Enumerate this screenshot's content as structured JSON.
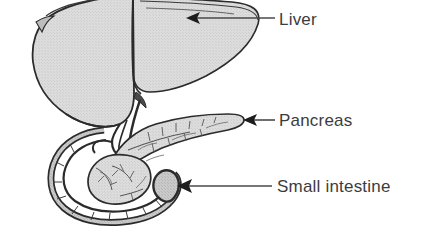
{
  "figure": {
    "kind": "anatomical-illustration",
    "background_color": "#ffffff",
    "organ_fill_color": "#d8d8d8",
    "organ_fill_color_dark": "#c3c3c3",
    "outline_color": "#2b2b2b",
    "label_color": "#3c3c3c",
    "leader_color": "#4a4a4a"
  },
  "labels": [
    {
      "id": "liver",
      "text": "Liver",
      "leader_from_x": 275,
      "leader_to_x": 196,
      "leader_y": 18,
      "arrow_tip_x": 186,
      "arrow_tip_y": 18
    },
    {
      "id": "pancreas",
      "text": "Pancreas",
      "leader_from_x": 275,
      "leader_to_x": 252,
      "leader_y": 120,
      "arrow_tip_x": 243,
      "arrow_tip_y": 120
    },
    {
      "id": "small-intestine",
      "text": "Small intestine",
      "leader_from_x": 272,
      "leader_to_x": 188,
      "leader_y": 186,
      "arrow_tip_x": 177,
      "arrow_tip_y": 186
    }
  ],
  "organs": [
    {
      "id": "liver",
      "name": "Liver",
      "description": "Large two-lobed organ occupying the upper left of the figure, cropped by the top edge"
    },
    {
      "id": "gallbladder",
      "name": "Gallbladder and bile duct",
      "description": "Small pouch and duct descending from the underside of the liver toward the duodenum"
    },
    {
      "id": "pancreas",
      "name": "Pancreas",
      "description": "Elongated tapering gland with branching internal duct texture, extending to the right"
    },
    {
      "id": "duodenum",
      "name": "Small intestine (duodenum)",
      "description": "C-shaped loop of bowel curving around the head of the pancreas"
    }
  ]
}
